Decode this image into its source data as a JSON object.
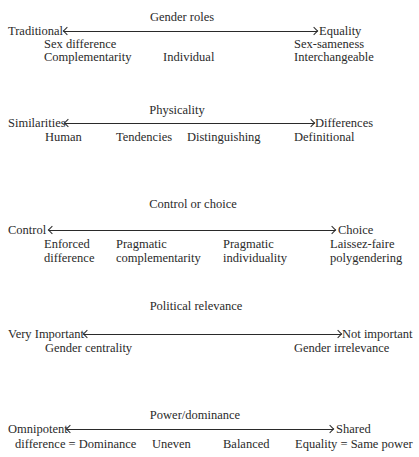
{
  "sections": [
    {
      "title": "Gender roles",
      "left": "Traditional",
      "right": "Equality",
      "labels": [
        "Sex difference",
        "Complementarity",
        "Individual",
        "Sex-sameness",
        "Interchangeable"
      ]
    },
    {
      "title": "Physicality",
      "left": "Similarities",
      "right": "Differences",
      "labels": [
        "Human",
        "Tendencies",
        "Distinguishing",
        "Definitional"
      ]
    },
    {
      "title": "Control or choice",
      "left": "Control",
      "right": "Choice",
      "labels": [
        "Enforced",
        "difference",
        "Pragmatic",
        "complementarity",
        "Pragmatic",
        "individuality",
        "Laissez-faire",
        "polygendering"
      ]
    },
    {
      "title": "Political relevance",
      "left": "Very Important",
      "right": "Not important",
      "labels": [
        "Gender centrality",
        "Gender irrelevance"
      ]
    },
    {
      "title": "Power/dominance",
      "left": "Omnipotent",
      "right": "Shared",
      "labels": [
        "difference = Dominance",
        "Uneven",
        "Balanced",
        "Equality = Same power"
      ]
    }
  ]
}
